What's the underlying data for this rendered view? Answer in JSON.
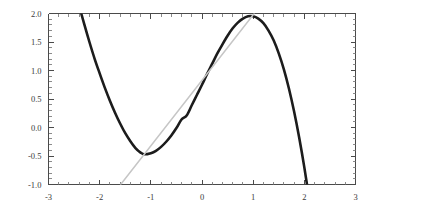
{
  "chart_data": {
    "type": "line",
    "title": "",
    "subtitle": "",
    "xlabel": "",
    "ylabel": "",
    "xlim": [
      -3,
      3
    ],
    "ylim": [
      -1.0,
      2.0
    ],
    "grid": false,
    "legend": null,
    "x_ticks": [
      -3,
      -2,
      -1,
      0,
      1,
      2,
      3
    ],
    "x_tick_labels": [
      "-3",
      "-2",
      "-1",
      "0",
      "1",
      "2",
      "3"
    ],
    "x_minor_step": 0.2,
    "y_ticks": [
      -1.0,
      -0.5,
      0.0,
      0.5,
      1.0,
      1.5,
      2.0
    ],
    "y_tick_labels": [
      "-1.0",
      "-0.5",
      "0.0",
      "0.5",
      "1.0",
      "1.5",
      "2.0"
    ],
    "y_minor_step": 0.1,
    "series": [
      {
        "name": "cubic-curve",
        "type": "line",
        "color": "#1c1c1c",
        "width": 2.6,
        "formula": "-0.55*x^3 + 0.1*x^2 + 1.85*x + 0.75",
        "x_domain": [
          -2.36,
          2.16
        ],
        "local_minimum": [
          -1.13,
          -0.47
        ],
        "local_maximum": [
          1.0,
          0.9
        ],
        "points": [
          [
            -2.36,
            2.0
          ],
          [
            -2.3,
            1.81
          ],
          [
            -2.2,
            1.5
          ],
          [
            -2.1,
            1.21
          ],
          [
            -2.0,
            0.95
          ],
          [
            -1.9,
            0.7
          ],
          [
            -1.8,
            0.47
          ],
          [
            -1.7,
            0.26
          ],
          [
            -1.6,
            0.07
          ],
          [
            -1.5,
            -0.1
          ],
          [
            -1.4,
            -0.24
          ],
          [
            -1.3,
            -0.36
          ],
          [
            -1.2,
            -0.44
          ],
          [
            -1.13,
            -0.47
          ],
          [
            -1.0,
            -0.45
          ],
          [
            -0.9,
            -0.41
          ],
          [
            -0.8,
            -0.34
          ],
          [
            -0.7,
            -0.25
          ],
          [
            -0.6,
            -0.14
          ],
          [
            -0.5,
            -0.01
          ],
          [
            -0.4,
            0.14
          ],
          [
            -0.3,
            0.21
          ],
          [
            -0.2,
            0.39
          ],
          [
            -0.1,
            0.57
          ],
          [
            0.0,
            0.75
          ],
          [
            0.1,
            0.94
          ],
          [
            0.2,
            1.12
          ],
          [
            0.3,
            1.3
          ],
          [
            0.4,
            1.46
          ],
          [
            0.5,
            1.61
          ],
          [
            0.6,
            1.74
          ],
          [
            0.7,
            1.84
          ],
          [
            0.8,
            1.91
          ],
          [
            0.9,
            1.95
          ],
          [
            1.0,
            1.95
          ],
          [
            1.1,
            1.91
          ],
          [
            1.2,
            1.83
          ],
          [
            1.3,
            1.7
          ],
          [
            1.4,
            1.53
          ],
          [
            1.5,
            1.3
          ],
          [
            1.6,
            1.02
          ],
          [
            1.7,
            0.68
          ],
          [
            1.8,
            0.28
          ],
          [
            1.9,
            -0.18
          ],
          [
            2.0,
            -0.7
          ],
          [
            2.1,
            -1.29
          ],
          [
            2.16,
            -1.67
          ]
        ]
      },
      {
        "name": "tangent-line",
        "type": "line",
        "color": "#c6c6c6",
        "width": 1.5,
        "slope": 1.15,
        "tangent_point": [
          -1.13,
          -0.47
        ],
        "points": [
          [
            -1.59,
            -1.0
          ],
          [
            1.02,
            2.0
          ]
        ]
      }
    ]
  }
}
